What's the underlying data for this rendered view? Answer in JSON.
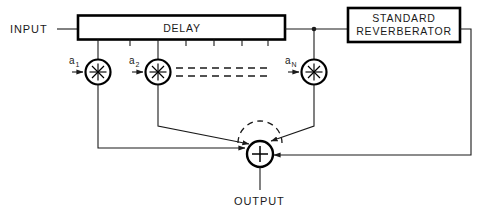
{
  "diagram": {
    "labels": {
      "input": "INPUT",
      "output": "OUTPUT",
      "delay_block": "DELAY",
      "reverb_line1": "STANDARD",
      "reverb_line2": "REVERBERATOR"
    },
    "coefficients": [
      {
        "base": "a",
        "sub": "1"
      },
      {
        "base": "a",
        "sub": "2"
      },
      {
        "base": "a",
        "sub": "N"
      }
    ],
    "operators": {
      "multiply_symbol": "asterisk-in-circle",
      "sum_symbol": "+"
    },
    "colors": {
      "line": "#1a1a1a",
      "block_stroke": "#000000",
      "background": "#ffffff"
    },
    "tap_count_visible": 3,
    "ellipsis_style": "double-dashed-line",
    "delay_tick_marks": 7
  }
}
